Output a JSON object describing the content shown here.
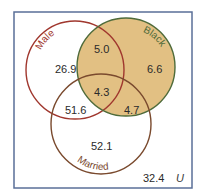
{
  "diagram": {
    "type": "venn",
    "universe_label": "U",
    "sets": [
      {
        "name": "Male",
        "color": "#a0372e"
      },
      {
        "name": "Black",
        "color": "#4f6b3a",
        "fill": "#e2c083"
      },
      {
        "name": "Married",
        "color": "#7a4a2e"
      }
    ],
    "regions": {
      "male_only": "26.9",
      "male_black": "5.0",
      "black_only": "6.6",
      "male_black_married": "4.3",
      "male_married": "51.6",
      "black_married": "4.7",
      "married_only": "52.1",
      "outside": "32.4"
    },
    "colors": {
      "frame": "#5a6f98",
      "shaded_fill": "#e2c083"
    }
  }
}
